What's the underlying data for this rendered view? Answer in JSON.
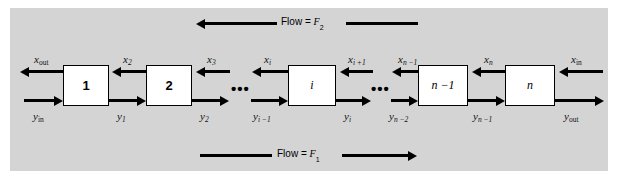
{
  "figure": {
    "background_color": "#d4d4d4",
    "box_fill": "#ffffff",
    "line_color": "#000000"
  },
  "flows": {
    "top": {
      "text_prefix": "Flow =",
      "symbol": "F",
      "subscript": "2",
      "direction": "left"
    },
    "bottom": {
      "text_prefix": "Flow =",
      "symbol": "F",
      "subscript": "1",
      "direction": "right"
    }
  },
  "stages": [
    {
      "id": "stage-1",
      "label": "1"
    },
    {
      "id": "stage-2",
      "label": "2"
    },
    {
      "id": "stage-i",
      "label": "i"
    },
    {
      "id": "stage-n-minus-1",
      "label": "n −1"
    },
    {
      "id": "stage-n",
      "label": "n"
    }
  ],
  "ellipses": [
    "•••",
    "•••"
  ],
  "top_stream_labels": [
    {
      "id": "x-out",
      "sym": "x",
      "sub": "out",
      "sub_roman": true
    },
    {
      "id": "x-2",
      "sym": "x",
      "sub": "2",
      "sub_roman": false
    },
    {
      "id": "x-3",
      "sym": "x",
      "sub": "3",
      "sub_roman": false
    },
    {
      "id": "x-i",
      "sym": "x",
      "sub": "i",
      "sub_roman": false
    },
    {
      "id": "x-i-plus-1",
      "sym": "x",
      "sub": "i +1",
      "sub_roman": false
    },
    {
      "id": "x-n-minus-1",
      "sym": "x",
      "sub": "n −1",
      "sub_roman": false
    },
    {
      "id": "x-n",
      "sym": "x",
      "sub": "n",
      "sub_roman": false
    },
    {
      "id": "x-in",
      "sym": "x",
      "sub": "in",
      "sub_roman": true
    }
  ],
  "bottom_stream_labels": [
    {
      "id": "y-in",
      "sym": "y",
      "sub": "in",
      "sub_roman": true
    },
    {
      "id": "y-1",
      "sym": "y",
      "sub": "1",
      "sub_roman": false
    },
    {
      "id": "y-2",
      "sym": "y",
      "sub": "2",
      "sub_roman": false
    },
    {
      "id": "y-i-minus-1",
      "sym": "y",
      "sub": "i −1",
      "sub_roman": false
    },
    {
      "id": "y-i",
      "sym": "y",
      "sub": "i",
      "sub_roman": false
    },
    {
      "id": "y-n-minus-2",
      "sym": "y",
      "sub": "n −2",
      "sub_roman": false
    },
    {
      "id": "y-n-minus-1",
      "sym": "y",
      "sub": "n −1",
      "sub_roman": false
    },
    {
      "id": "y-out",
      "sym": "y",
      "sub": "out",
      "sub_roman": true
    }
  ]
}
